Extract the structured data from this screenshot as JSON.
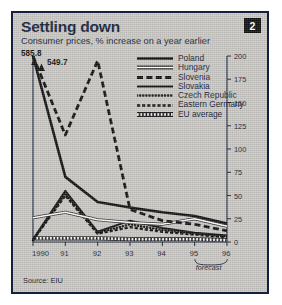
{
  "figure": {
    "title": "Settling down",
    "subtitle": "Consumer prices, % increase on a year earlier",
    "badge": "2",
    "source": "Source: EIU",
    "forecast_label": "forecast"
  },
  "colors": {
    "panel_background": "#c9c8c4",
    "border": "#14203c",
    "ink": "#14203c",
    "line_dark": "#111111",
    "line_light": "#ffffff",
    "badge_background": "#0e0e0e",
    "badge_text": "#ffffff"
  },
  "annotations": [
    {
      "name": "poland-offscale-value",
      "text": "585.8"
    },
    {
      "name": "slovenia-offscale-value",
      "text": "549.7"
    }
  ],
  "chart_data": {
    "type": "line",
    "title": "Settling down",
    "subtitle": "Consumer prices, % increase on a year earlier",
    "xlabel": "",
    "ylabel": "",
    "x": [
      1990,
      1991,
      1992,
      1993,
      1994,
      1995,
      1996
    ],
    "xtick_labels": [
      "1990",
      "91",
      "92",
      "93",
      "94",
      "95",
      "96"
    ],
    "ytick_labels": [
      "0",
      "25",
      "50",
      "75",
      "100",
      "125",
      "150",
      "175",
      "200"
    ],
    "yticks": [
      0,
      25,
      50,
      75,
      100,
      125,
      150,
      175,
      200
    ],
    "ylim": [
      0,
      200
    ],
    "y_axis_side": "right",
    "grid": false,
    "legend_position": "upper-right-inside",
    "forecast_from": 1995,
    "offscale_note": "Poland 1990 = 585.8 and Slovenia 1990 = 549.7 are above the 200 axis maximum and shown with arrows",
    "series": [
      {
        "name": "Poland",
        "style": "solid-thick",
        "color": "#111111",
        "values": [
          585.8,
          70,
          43,
          37,
          32,
          28,
          20
        ]
      },
      {
        "name": "Hungary",
        "style": "solid-white",
        "color": "#ffffff",
        "values": [
          26,
          32,
          24,
          21,
          19,
          25,
          17
        ]
      },
      {
        "name": "Slovenia",
        "style": "dashed-thick",
        "color": "#111111",
        "values": [
          549.7,
          115,
          195,
          35,
          23,
          19,
          12
        ]
      },
      {
        "name": "Slovakia",
        "style": "solid-medium",
        "color": "#111111",
        "values": [
          3,
          55,
          11,
          23,
          15,
          10,
          7
        ]
      },
      {
        "name": "Czech Republic",
        "style": "dotted-round",
        "color": "#111111",
        "values": [
          2,
          52,
          10,
          19,
          13,
          9,
          6
        ]
      },
      {
        "name": "Eastern Germany",
        "style": "dashed-short",
        "color": "#111111",
        "values": [
          2,
          50,
          9,
          16,
          11,
          8,
          5
        ]
      },
      {
        "name": "EU average",
        "style": "dotted-square-white",
        "color": "#ffffff",
        "values": [
          4,
          4,
          4,
          3,
          3,
          3,
          2
        ]
      }
    ]
  }
}
